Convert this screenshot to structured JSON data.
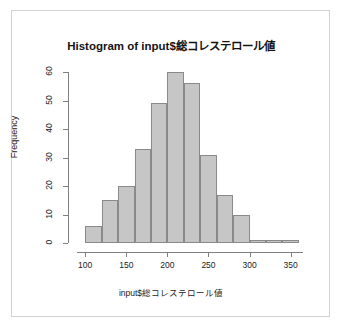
{
  "chart_data": {
    "type": "bar",
    "title": "Histogram of input$総コレステロール値",
    "xlabel": "input$総コレステロール値",
    "ylabel": "Frequency",
    "grid": false,
    "legend": false,
    "xlim": [
      90,
      365
    ],
    "ylim": [
      0,
      62
    ],
    "bin_width": 20,
    "bin_edges": [
      100,
      120,
      140,
      160,
      180,
      200,
      220,
      240,
      260,
      280,
      300,
      320,
      340,
      360
    ],
    "categories": [
      "100-120",
      "120-140",
      "140-160",
      "160-180",
      "180-200",
      "200-220",
      "220-240",
      "240-260",
      "260-280",
      "280-300",
      "300-320",
      "320-340",
      "340-360"
    ],
    "values": [
      6,
      15,
      20,
      33,
      49,
      60,
      56,
      31,
      17,
      10,
      1,
      1,
      1
    ],
    "xticks": [
      100,
      150,
      200,
      250,
      300,
      350
    ],
    "xtick_labels": [
      "100",
      "150",
      "200",
      "250",
      "300",
      "350"
    ],
    "yticks": [
      0,
      10,
      20,
      30,
      40,
      50,
      60
    ],
    "ytick_labels": [
      "0",
      "10",
      "20",
      "30",
      "40",
      "50",
      "60"
    ],
    "bar_fill_color": "#c6c6c6",
    "bar_border_color": "#8a8a8a",
    "axis_color": "#808080",
    "frame_color": "#d2d2d2",
    "background_color": "#ffffff"
  }
}
